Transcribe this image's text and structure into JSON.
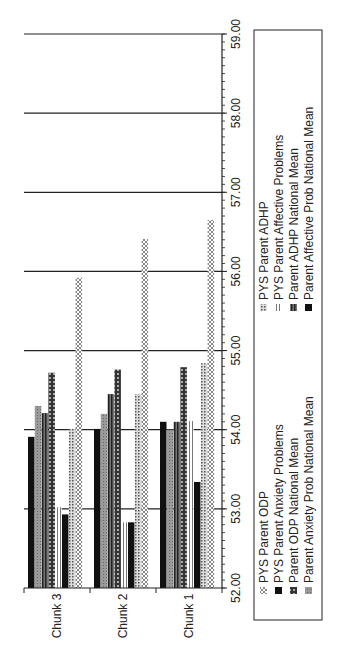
{
  "chart_data": {
    "type": "bar",
    "orientation": "vertical bars, whole figure rotated 90deg counterclockwise",
    "title": "",
    "xlabel": "",
    "ylabel": "",
    "categories": [
      "Chunk 3",
      "Chunk 2",
      "Chunk 1"
    ],
    "ylim": [
      52.0,
      59.0
    ],
    "y_ticks": [
      "52.00",
      "53.00",
      "54.00",
      "55.00",
      "56.00",
      "57.00",
      "58.00",
      "59.00"
    ],
    "y_minor_tick_step": 0.1,
    "grid": "major horizontal gridlines",
    "legend_position": "right (rendered at bottom-right of rotated figure)",
    "series": [
      {
        "name": "PYS Parent Anxiety Problems",
        "pattern": "solid-black",
        "color": "#111111",
        "values": [
          53.91,
          54.01,
          54.1
        ]
      },
      {
        "name": "Parent Anxiety Prob National Mean",
        "pattern": "grey-dots",
        "color": "#8a8a8a",
        "values": [
          54.3,
          54.2,
          54.0
        ]
      },
      {
        "name": "Parent ADHP National Mean",
        "pattern": "dark-vertical-stripes",
        "color": "#444444",
        "values": [
          54.21,
          54.45,
          54.1
        ]
      },
      {
        "name": "Parent ODP National Mean",
        "pattern": "dark-checker",
        "color": "#333333",
        "values": [
          54.72,
          54.76,
          54.79
        ]
      },
      {
        "name": "PYS Parent Affective Problems",
        "pattern": "light-vertical-stripes",
        "color": "#bbbbbb",
        "values": [
          53.02,
          52.83,
          54.11
        ]
      },
      {
        "name": "Parent Affective Prob National Mean",
        "pattern": "solid-black",
        "color": "#111111",
        "values": [
          52.93,
          52.83,
          53.34
        ]
      },
      {
        "name": "PYS Parent ADHP",
        "pattern": "fine-dots",
        "color": "#999999",
        "values": [
          54.01,
          54.45,
          54.84
        ]
      },
      {
        "name": "PYS Parent ODP",
        "pattern": "crosshatch",
        "color": "#aaaaaa",
        "values": [
          55.92,
          56.41,
          56.65
        ]
      }
    ]
  },
  "legend": {
    "items": [
      {
        "label": "PYS Parent ODP",
        "pattern": "crosshatch"
      },
      {
        "label": "PYS Parent Anxiety Problems",
        "pattern": "solid-black"
      },
      {
        "label": "Parent ODP National Mean",
        "pattern": "dark-checker"
      },
      {
        "label": "Parent Anxiety Prob National Mean",
        "pattern": "grey-dots"
      },
      {
        "label": "PYS Parent ADHP",
        "pattern": "fine-dots"
      },
      {
        "label": "PYS Parent Affective Problems",
        "pattern": "light-vertical-stripes"
      },
      {
        "label": "Parent ADHP National Mean",
        "pattern": "dark-vertical-stripes"
      },
      {
        "label": "Parent Affective Prob National Mean",
        "pattern": "solid-black"
      }
    ]
  }
}
